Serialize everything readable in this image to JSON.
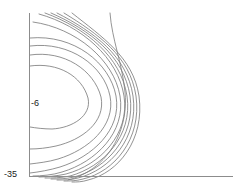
{
  "figure": {
    "background": "#ffffff",
    "line_color": "#6e6e6e",
    "axis_color": "#8c8c8c",
    "label_color": "#1a1a1a"
  },
  "labels": {
    "inner_contour": "-6",
    "outer_contour": "-35"
  },
  "chart_data": {
    "type": "line",
    "subtype": "contour",
    "title": "",
    "xlabel": "",
    "ylabel": "",
    "grid": false,
    "legend": false,
    "axis_style": "left-and-bottom-spine-only",
    "xlim": [
      0,
      1
    ],
    "ylim": [
      0,
      1
    ],
    "annotations": [
      {
        "text": "-6",
        "x_px": 31,
        "y_px": 103,
        "level": -6
      },
      {
        "text": "-35",
        "x_px": 8,
        "y_px": 174,
        "level": -35
      }
    ],
    "contour_levels": [
      -6,
      -35
    ],
    "contour_level_count": 12,
    "series": [
      {
        "name": "level-1-innermost",
        "label": "-6",
        "d": "M30,66 C58,62 82,76 88,98 C92,116 72,128 52,129 C44,129 36,128 30,127"
      },
      {
        "name": "level-2",
        "d": "M30,55 C64,50 94,70 101,97 C106,122 82,140 56,146 C47,148 38,149 30,149"
      },
      {
        "name": "level-3",
        "d": "M30,46 C70,41 104,66 110,96 C116,126 88,150 58,159 C48,162 38,163 30,164"
      },
      {
        "name": "level-4",
        "d": "M30,38 C74,34 110,63 116,96 C122,130 92,157 60,167 C50,170 39,172 30,173"
      },
      {
        "name": "level-5",
        "d": "M33,22 C76,28 114,60 120,96 C126,132 96,162 62,172 C53,175 41,176 33,176"
      },
      {
        "name": "level-6",
        "d": "M39,14 C82,26 118,58 124,96 C130,134 100,165 66,174 C57,176 46,177 39,177"
      },
      {
        "name": "level-7",
        "d": "M45,13 C86,28 121,57 127,96 C133,136 103,167 70,176 C61,178 52,178 45,178"
      },
      {
        "name": "level-8",
        "d": "M51,13 C90,30 124,56 130,96 C136,137 106,169 74,177 C66,179 58,179 51,179"
      },
      {
        "name": "level-9",
        "d": "M57,13 C94,32 127,56 133,96 C139,138 110,170 78,178 C71,180 64,180 57,180"
      },
      {
        "name": "level-10",
        "d": "M64,13 C98,34 130,56 136,96 C142,139 114,172 83,179 C76,181 70,181 64,181"
      },
      {
        "name": "level-11",
        "d": "M72,13 C102,37 133,57 139,96 C145,140 118,173 88,180 C82,182 77,182 72,182"
      },
      {
        "name": "level-12-outermost",
        "label": "-35",
        "d": "M110,13 C112,40 122,62 125,92 C128,122 116,150 96,166 C86,174 76,178 68,180"
      }
    ],
    "axes": {
      "vertical_spine": {
        "x_px": 29.5,
        "y0_px": 13,
        "y1_px": 176
      },
      "horizontal_spine": {
        "y_px": 176.5,
        "x0_px": 29,
        "x1_px": 233
      }
    }
  }
}
